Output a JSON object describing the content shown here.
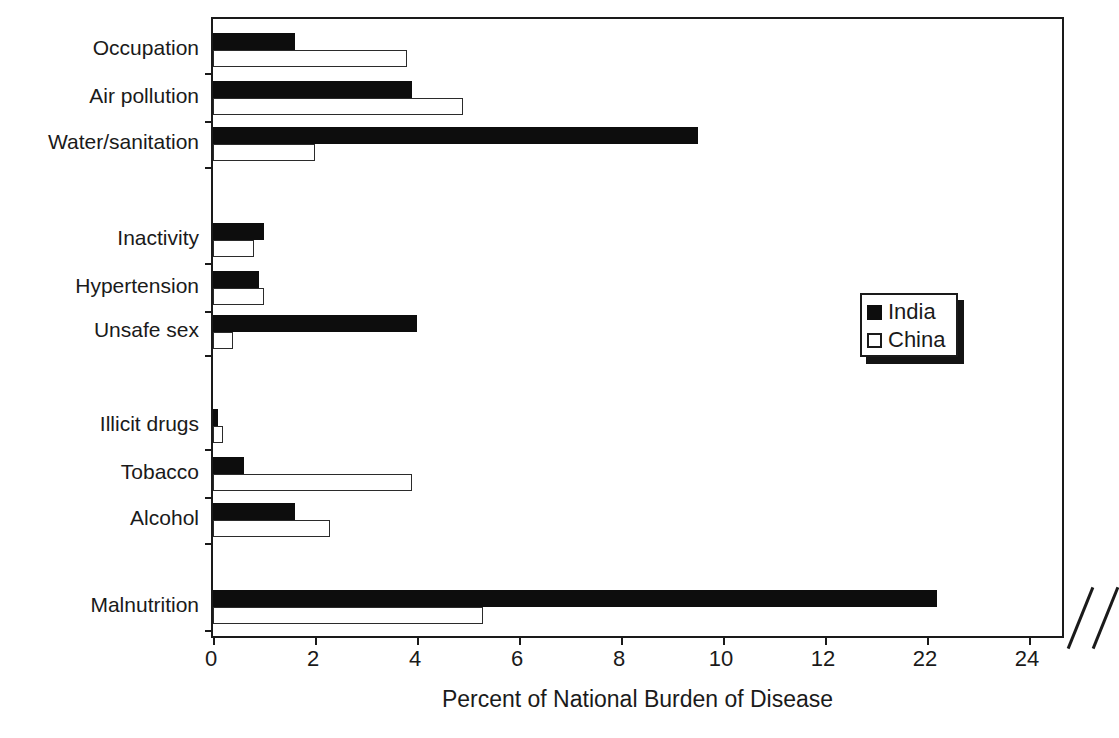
{
  "chart_data": {
    "type": "bar",
    "orientation": "horizontal",
    "title": "",
    "xlabel": "Percent of National Burden of Disease",
    "ylabel": "",
    "xlim": [
      0,
      24
    ],
    "xticks": [
      0,
      2,
      4,
      6,
      8,
      10,
      12,
      22,
      24
    ],
    "xtick_labels": [
      "0",
      "2",
      "4",
      "6",
      "8",
      "10",
      "12",
      "22",
      "24"
    ],
    "axis_break": {
      "present": true,
      "between": [
        12,
        22
      ]
    },
    "grid": false,
    "legend_position": "right",
    "categories": [
      "Occupation",
      "Air pollution",
      "Water/sanitation",
      "Inactivity",
      "Hypertension",
      "Unsafe sex",
      "Illicit drugs",
      "Tobacco",
      "Alcohol",
      "Malnutrition"
    ],
    "series": [
      {
        "name": "India",
        "style": "filled-black",
        "values": [
          1.6,
          3.9,
          9.5,
          1.0,
          0.9,
          4.0,
          0.1,
          0.6,
          1.6,
          22.2
        ]
      },
      {
        "name": "China",
        "style": "hollow-white",
        "values": [
          3.8,
          4.9,
          2.0,
          0.8,
          1.0,
          0.4,
          0.2,
          3.9,
          2.3,
          5.3
        ]
      }
    ]
  },
  "legend": {
    "entries": [
      {
        "label": "India",
        "swatch": "filled-square-icon"
      },
      {
        "label": "China",
        "swatch": "hollow-square-icon"
      }
    ]
  },
  "colors": {
    "india": "#0d0d0d",
    "china": "#ffffff",
    "axis": "#1a1a1a",
    "background": "#ffffff"
  }
}
